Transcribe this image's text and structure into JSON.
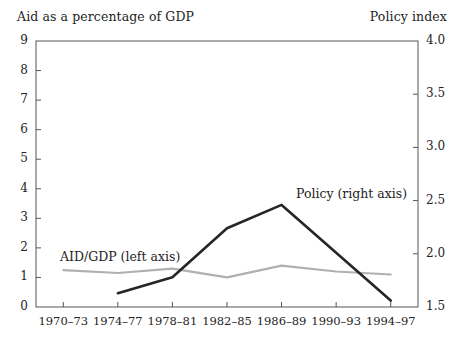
{
  "chart_data": {
    "type": "line",
    "title": "",
    "categories": [
      "1970–73",
      "1974–77",
      "1978–81",
      "1982–85",
      "1986–89",
      "1990–93",
      "1994–97"
    ],
    "left_axis": {
      "label": "Aid as a percentage of GDP",
      "ylim": [
        0,
        9
      ],
      "ticks": [
        "0",
        "1",
        "2",
        "3",
        "4",
        "5",
        "6",
        "7",
        "8",
        "9"
      ],
      "tick_values": [
        0,
        1,
        2,
        3,
        4,
        5,
        6,
        7,
        8,
        9
      ]
    },
    "right_axis": {
      "label": "Policy index",
      "ylim": [
        1.5,
        4.0
      ],
      "ticks": [
        "1.5",
        "2.0",
        "2.5",
        "3.0",
        "3.5",
        "4.0"
      ],
      "tick_values": [
        1.5,
        2.0,
        2.5,
        3.0,
        3.5,
        4.0
      ]
    },
    "xlabel": "",
    "grid": false,
    "legend_position": "inline-annotations",
    "series": [
      {
        "name": "AID/GDP (left axis)",
        "axis": "left",
        "color": "#b0b0b0",
        "label_text": "AID/GDP (left axis)",
        "x": [
          "1970–73",
          "1974–77",
          "1978–81",
          "1982–85",
          "1986–89",
          "1990–93",
          "1994–97"
        ],
        "values": [
          1.25,
          1.15,
          1.3,
          1.0,
          1.4,
          1.2,
          1.1
        ]
      },
      {
        "name": "Policy (right axis)",
        "axis": "right",
        "color": "#262626",
        "label_text": "Policy (right axis)",
        "x": [
          "1974–77",
          "1978–81",
          "1982–85",
          "1986–89",
          "1994–97"
        ],
        "values": [
          1.63,
          1.78,
          2.24,
          2.46,
          1.56
        ]
      }
    ],
    "annotations": [
      {
        "text": "AID/GDP (left axis)",
        "for_series": "AID/GDP (left axis)"
      },
      {
        "text": "Policy (right axis)",
        "for_series": "Policy (right axis)"
      }
    ],
    "colors": {
      "aid_gdp_line": "#b0b0b0",
      "policy_line": "#262626",
      "axis": "#555555",
      "text": "#242424",
      "background": "#ffffff"
    }
  }
}
